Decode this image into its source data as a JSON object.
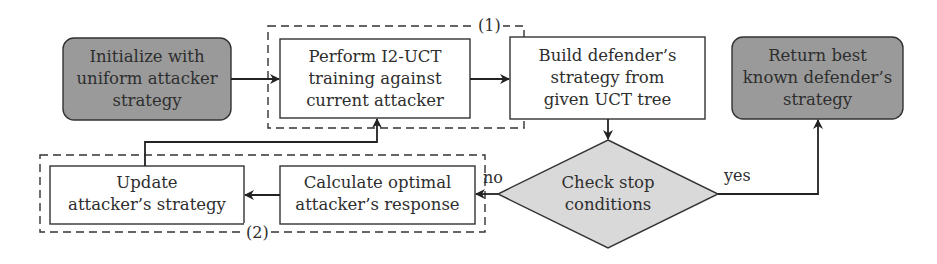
{
  "diagram": {
    "nodes": {
      "init": {
        "label": [
          "Initialize with",
          "uniform attacker",
          "strategy"
        ],
        "shape": "rounded-rect",
        "fill": "#9a9a9a"
      },
      "train": {
        "label": [
          "Perform I2-UCT",
          "training against",
          "current attacker"
        ],
        "shape": "rect",
        "fill": "#ffffff"
      },
      "build": {
        "label": [
          "Build defender’s",
          "strategy from",
          "given UCT tree"
        ],
        "shape": "rect",
        "fill": "#ffffff"
      },
      "ret": {
        "label": [
          "Return best",
          "known defender’s",
          "strategy"
        ],
        "shape": "rounded-rect",
        "fill": "#9a9a9a"
      },
      "check": {
        "label": [
          "Check stop",
          "conditions"
        ],
        "shape": "diamond",
        "fill": "#d9d9d9"
      },
      "calc": {
        "label": [
          "Calculate optimal",
          "attacker’s response"
        ],
        "shape": "rect",
        "fill": "#ffffff"
      },
      "update": {
        "label": [
          "Update",
          "attacker’s strategy"
        ],
        "shape": "rect",
        "fill": "#ffffff"
      }
    },
    "groups": {
      "g1": {
        "label": "(1)"
      },
      "g2": {
        "label": "(2)"
      }
    },
    "edges": {
      "no_label": "no",
      "yes_label": "yes"
    }
  }
}
